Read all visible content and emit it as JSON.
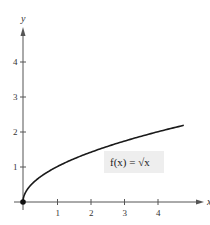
{
  "chart_data": {
    "type": "line",
    "title": "",
    "xlabel": "x",
    "ylabel": "y",
    "xlim": [
      0,
      5.3
    ],
    "ylim": [
      0,
      5
    ],
    "x_ticks": [
      1,
      2,
      3,
      4
    ],
    "y_ticks": [
      1,
      2,
      3,
      4
    ],
    "grid": false,
    "series": [
      {
        "name": "f(x) = √x",
        "function": "sqrt(x)",
        "x": [
          0,
          0.25,
          0.5,
          1,
          1.5,
          2,
          2.5,
          3,
          3.5,
          4,
          4.5,
          4.8
        ],
        "values": [
          0,
          0.5,
          0.707,
          1,
          1.225,
          1.414,
          1.581,
          1.732,
          1.871,
          2,
          2.121,
          2.191
        ]
      }
    ],
    "annotations": [
      {
        "text": "f(x) = √x",
        "position": "right, below curve, shaded box"
      },
      {
        "text": "point",
        "x": 0,
        "y": 0,
        "marker": "filled-circle"
      }
    ],
    "colors": {
      "curve": "#1a1a1a",
      "axes": "#555555",
      "label_box": "#eeeeee"
    }
  },
  "labels": {
    "x_axis": "x",
    "y_axis": "y",
    "function": "f(x) = √x",
    "x_ticks": [
      "1",
      "2",
      "3",
      "4"
    ],
    "y_ticks": [
      "1",
      "2",
      "3",
      "4"
    ]
  }
}
